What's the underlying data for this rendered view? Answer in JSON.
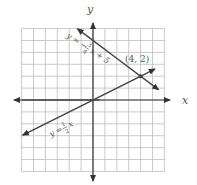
{
  "chart_data": {
    "type": "line",
    "title": "",
    "xlabel": "x",
    "ylabel": "y",
    "xlim": [
      -6,
      6
    ],
    "ylim": [
      -6,
      6
    ],
    "grid": true,
    "series": [
      {
        "name": "y = -3/4 x + 5",
        "equation": "y = -¾ x + 5",
        "slope": -0.75,
        "intercept": 5,
        "x_range": [
          -1.3,
          5.5
        ]
      },
      {
        "name": "y = 1/2 x",
        "equation": "y = ½ x",
        "slope": 0.5,
        "intercept": 0,
        "x_range": [
          -5.9,
          5.2
        ]
      }
    ],
    "annotations": [
      {
        "text": "(4, 2)",
        "x": 4,
        "y": 2
      }
    ]
  },
  "axes": {
    "x_label": "x",
    "y_label": "y"
  },
  "lines": {
    "line1": {
      "lhs": "y = −",
      "num": "3",
      "den": "4",
      "rhs": "x + 5"
    },
    "line2": {
      "lhs": "y =",
      "num": "1",
      "den": "2",
      "rhs": "x"
    }
  },
  "intersection": {
    "label": "(4, 2)"
  },
  "colors": {
    "grid": "#b8b8b8",
    "axis": "#333333",
    "line": "#444444",
    "text": "#555555"
  }
}
